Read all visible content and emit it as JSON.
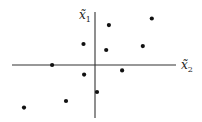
{
  "diagram": {
    "type": "scatter",
    "axes": {
      "vertical": {
        "symbol": "x̃",
        "subscript": "1"
      },
      "horizontal": {
        "symbol": "x̃",
        "subscript": "2"
      }
    },
    "points": [
      {
        "x2": -0.35,
        "x1": 0.7
      },
      {
        "x2": 0.42,
        "x1": 1.33
      },
      {
        "x2": 0.34,
        "x1": 0.5
      },
      {
        "x2": 1.72,
        "x1": 1.55
      },
      {
        "x2": 1.45,
        "x1": 0.63
      },
      {
        "x2": -1.3,
        "x1": 0.0
      },
      {
        "x2": -0.33,
        "x1": -0.32
      },
      {
        "x2": 0.82,
        "x1": -0.18
      },
      {
        "x2": 0.06,
        "x1": -0.9
      },
      {
        "x2": -0.88,
        "x1": -1.2
      },
      {
        "x2": -2.15,
        "x1": -1.42
      }
    ]
  }
}
